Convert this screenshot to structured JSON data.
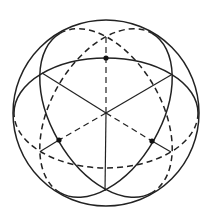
{
  "diagram": {
    "colors": {
      "stroke": "#222222",
      "background": "#ffffff",
      "dot": "#111111"
    },
    "sphere": {
      "cx": 106,
      "cy": 113,
      "r": 93
    },
    "great_circles": [
      {
        "name": "great-circle-horizontal",
        "rotation_deg": 0,
        "rx": 92,
        "ry": 55
      },
      {
        "name": "great-circle-tilted-right",
        "rotation_deg": 60,
        "rx": 92,
        "ry": 55
      },
      {
        "name": "great-circle-tilted-left",
        "rotation_deg": 120,
        "rx": 92,
        "ry": 55
      }
    ],
    "vertices": [
      {
        "name": "top",
        "x": 106,
        "y": 35
      },
      {
        "name": "upper-left",
        "x": 42,
        "y": 73
      },
      {
        "name": "upper-right",
        "x": 171,
        "y": 75
      },
      {
        "name": "lower-left",
        "x": 41,
        "y": 151
      },
      {
        "name": "lower-right",
        "x": 171,
        "y": 152
      },
      {
        "name": "bottom",
        "x": 105,
        "y": 191
      }
    ],
    "points": [
      {
        "name": "point-top",
        "x": 106,
        "y": 58
      },
      {
        "name": "point-lower-left",
        "x": 59,
        "y": 140
      },
      {
        "name": "point-lower-right",
        "x": 152,
        "y": 141
      }
    ]
  }
}
